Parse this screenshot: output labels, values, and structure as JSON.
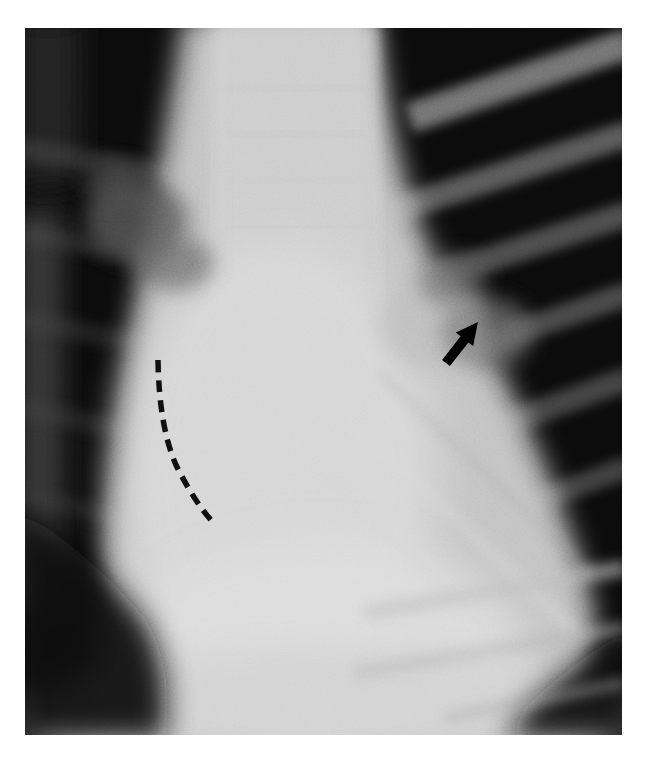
{
  "page": {
    "background_color": "#ffffff"
  },
  "figure": {
    "type": "chest radiograph, frontal projection (printed halftone film image)",
    "image_left_px": 25,
    "image_top_px": 28,
    "image_width_px": 597,
    "image_height_px": 707
  },
  "annotations": {
    "arrow": {
      "name": "black solid arrow",
      "points": "453,294 448.2,318.1 443.4,314.4 424.9,338.1 417.1,331.9 435.6,308.2 430.8,304.5",
      "color": "#000000",
      "tip_x": 453,
      "tip_y": 294,
      "tail_x": 421,
      "tail_y": 335,
      "direction": "pointing up and to the right"
    },
    "dashed_line": {
      "name": "black dashed contour line",
      "path": "M133,332 Q134,398 151,437 Q169,473 186,492",
      "color": "#101010",
      "dasharray": "12 8",
      "stroke_width": 5.5
    }
  },
  "palette": {
    "page_white": "#ffffff",
    "film_dark": "#0b0b0b",
    "lung_field_dark": "#101010",
    "mediastinum_light": "#c4c4c4",
    "rib_shadow_gray": "#8a8a8a",
    "annotation_black": "#000000"
  }
}
